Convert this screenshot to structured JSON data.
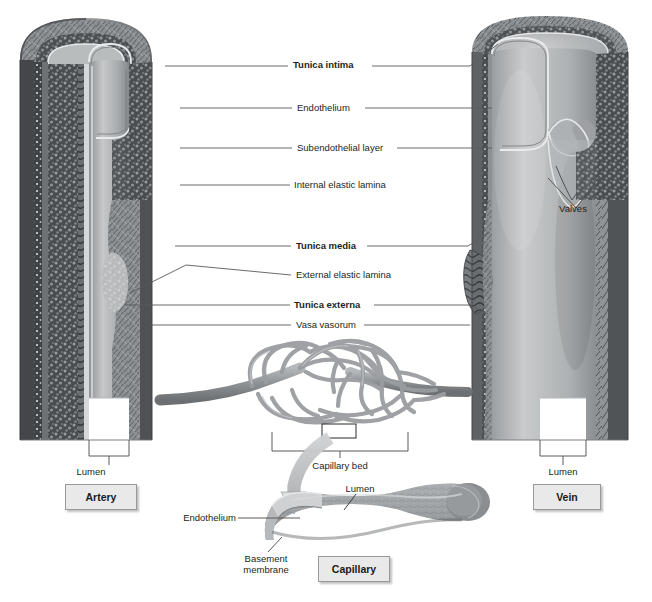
{
  "figure": {
    "background_color": "#ffffff",
    "text_color": "#231f20",
    "leader_color": "#5a5a5a",
    "box_fill": "#e9e9e9",
    "box_border": "#9a9a9a"
  },
  "center_labels": [
    {
      "text": "Tunica intima",
      "bold": true,
      "x": 293,
      "y": 63,
      "leader_left_to": 165,
      "leader_right_to": 472
    },
    {
      "text": "Endothelium",
      "bold": false,
      "x": 297,
      "y": 105,
      "leader_left_to": 180,
      "leader_right_to": 470
    },
    {
      "text": "Subendothelial layer",
      "bold": false,
      "x": 297,
      "y": 145,
      "leader_left_to": 180,
      "leader_right_to": 470
    },
    {
      "text": "Internal elastic lamina",
      "bold": false,
      "x": 292,
      "y": 182,
      "leader_left_to": 180,
      "leader_right_to": 470
    },
    {
      "text": "Tunica media",
      "bold": true,
      "x": 296,
      "y": 243,
      "leader_left_to": 175,
      "leader_right_to": 468
    },
    {
      "text": "External elastic lamina",
      "bold": false,
      "x": 296,
      "y": 272,
      "leader_left_to": 185,
      "leader_right_to": 470
    },
    {
      "text": "Tunica externa",
      "bold": true,
      "x": 293,
      "y": 302,
      "leader_left_to": 178,
      "leader_right_to": 468
    },
    {
      "text": "Vasa vasorum",
      "bold": false,
      "x": 296,
      "y": 322,
      "leader_left_to": 178,
      "leader_right_to": 470
    }
  ],
  "artery": {
    "lumen_label": "Lumen",
    "lumen_label_x": 82,
    "lumen_label_y": 468,
    "box_label": "Artery",
    "box_x": 65,
    "box_y": 484,
    "box_w": 70,
    "box_h": 24
  },
  "vein": {
    "lumen_label": "Lumen",
    "lumen_label_x": 553,
    "lumen_label_y": 468,
    "valves_label": "Valves",
    "valves_label_x": 562,
    "valves_label_y": 206,
    "box_label": "Vein",
    "box_x": 533,
    "box_y": 484,
    "box_w": 66,
    "box_h": 24
  },
  "capillary_bed": {
    "label": "Capillary bed",
    "label_x": 318,
    "label_y": 463
  },
  "capillary": {
    "box_label": "Capillary",
    "box_x": 318,
    "box_y": 556,
    "box_w": 70,
    "box_h": 24,
    "lumen_label": "Lumen",
    "lumen_label_x": 334,
    "lumen_label_y": 489,
    "endothelium_label": "Endothelium",
    "endothelium_label_x": 172,
    "endothelium_label_y": 515,
    "basement_membrane_label_line1": "Basement",
    "basement_membrane_label_line2": "membrane",
    "basement_label_x": 230,
    "basement_label_y": 556
  }
}
